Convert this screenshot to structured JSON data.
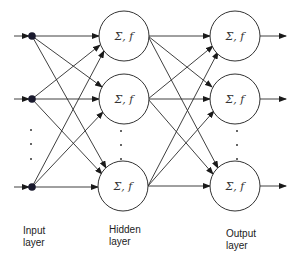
{
  "diagram": {
    "type": "feedforward-neural-network",
    "node_function_label": "Σ, f",
    "layers": [
      {
        "id": "input",
        "label_line1": "Input",
        "label_line2": "layer",
        "nodes_shown": 3,
        "has_ellipsis": true
      },
      {
        "id": "hidden",
        "label_line1": "Hidden",
        "label_line2": "layer",
        "nodes_shown": 3,
        "has_ellipsis": true
      },
      {
        "id": "output",
        "label_line1": "Output",
        "label_line2": "layer",
        "nodes_shown": 3,
        "has_ellipsis": true
      }
    ],
    "connections": "fully-connected",
    "colors": {
      "stroke": "#333333",
      "input_node": "#1a1a2e",
      "background": "#ffffff"
    }
  },
  "labels": {
    "input_1": "Input",
    "input_2": "layer",
    "hidden_1": "Hidden",
    "hidden_2": "layer",
    "output_1": "Output",
    "output_2": "layer"
  },
  "nodes": {
    "h1": "Σ, f",
    "h2": "Σ, f",
    "h3": "Σ, f",
    "o1": "Σ, f",
    "o2": "Σ, f",
    "o3": "Σ, f"
  }
}
